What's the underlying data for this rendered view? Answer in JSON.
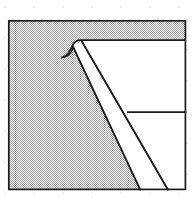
{
  "figure": {
    "title": "Hatched square with folded corner diagram",
    "kind": "line-drawing",
    "canvas": {
      "width": 195,
      "height": 198,
      "background_color": "#ffffff"
    },
    "colors": {
      "ink": "#1a1a1a",
      "stipple_dark": "#9a9a9a",
      "stipple_light": "#e8e8e8",
      "paper": "#ffffff",
      "speckle": "#f0f0f0"
    },
    "frame": {
      "label": "outer-square-frame",
      "x": 8,
      "y": 20,
      "width": 178,
      "height": 170,
      "stroke_width": 1.6
    },
    "regions": [
      {
        "name": "stippled-field",
        "fill": "stipple",
        "note": "fine checkerboard dither filling the frame behind the white shape"
      },
      {
        "name": "white-fold-band",
        "fill": "paper",
        "note": "narrow white band running diagonally down-right"
      },
      {
        "name": "white-upper-panel",
        "fill": "paper",
        "note": "white area to the right of the diagonal, below the top edge"
      }
    ],
    "strokes": [
      {
        "name": "top-edge-line",
        "from": [
          75,
          40
        ],
        "to": [
          186,
          40
        ]
      },
      {
        "name": "hook-curl",
        "from": [
          62,
          57
        ],
        "to": [
          78,
          40
        ]
      },
      {
        "name": "diagonal-left-line",
        "from": [
          72,
          45
        ],
        "to": [
          140,
          190
        ]
      },
      {
        "name": "diagonal-right-line",
        "from": [
          82,
          41
        ],
        "to": [
          168,
          190
        ]
      },
      {
        "name": "horizontal-divider-line",
        "from": [
          128,
          112
        ],
        "to": [
          186,
          112
        ]
      }
    ]
  }
}
